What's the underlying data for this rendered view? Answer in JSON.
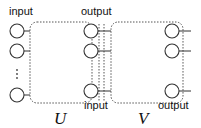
{
  "diagram": {
    "modules": [
      {
        "name": "U",
        "input_label": "input",
        "output_label": "output",
        "input_nodes": 3,
        "output_nodes": 3,
        "has_ellipsis": true
      },
      {
        "name": "V",
        "input_label": "input",
        "output_label": "output",
        "output_nodes": 3
      }
    ],
    "labels": {
      "u_input_top": "input",
      "u_output_top": "output",
      "v_input_bottom": "input",
      "v_output_bottom": "output",
      "u_name": "U",
      "v_name": "V"
    }
  }
}
